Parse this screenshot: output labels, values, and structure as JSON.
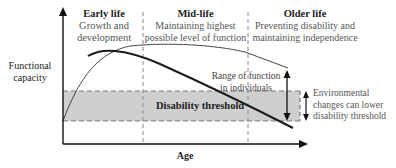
{
  "diagram": {
    "stages": [
      {
        "title": "Early life",
        "line1": "Growth and",
        "line2": "development"
      },
      {
        "title": "Mid-life",
        "line1": "Maintaining highest",
        "line2": "possible level of function"
      },
      {
        "title": "Older life",
        "line1": "Preventing disability and",
        "line2": "maintaining independence"
      }
    ],
    "y_axis_label_1": "Functional",
    "y_axis_label_2": "capacity",
    "x_axis_label": "Age",
    "threshold_label": "Disability threshold",
    "range_label_1": "Range of function",
    "range_label_2": "in individuals",
    "env_label_1": "Environmental",
    "env_label_2": "changes can lower",
    "env_label_3": "disability threshold",
    "colors": {
      "threshold_fill": "#cfcfcf",
      "line": "#1a1a1a",
      "dash": "#777777"
    }
  }
}
